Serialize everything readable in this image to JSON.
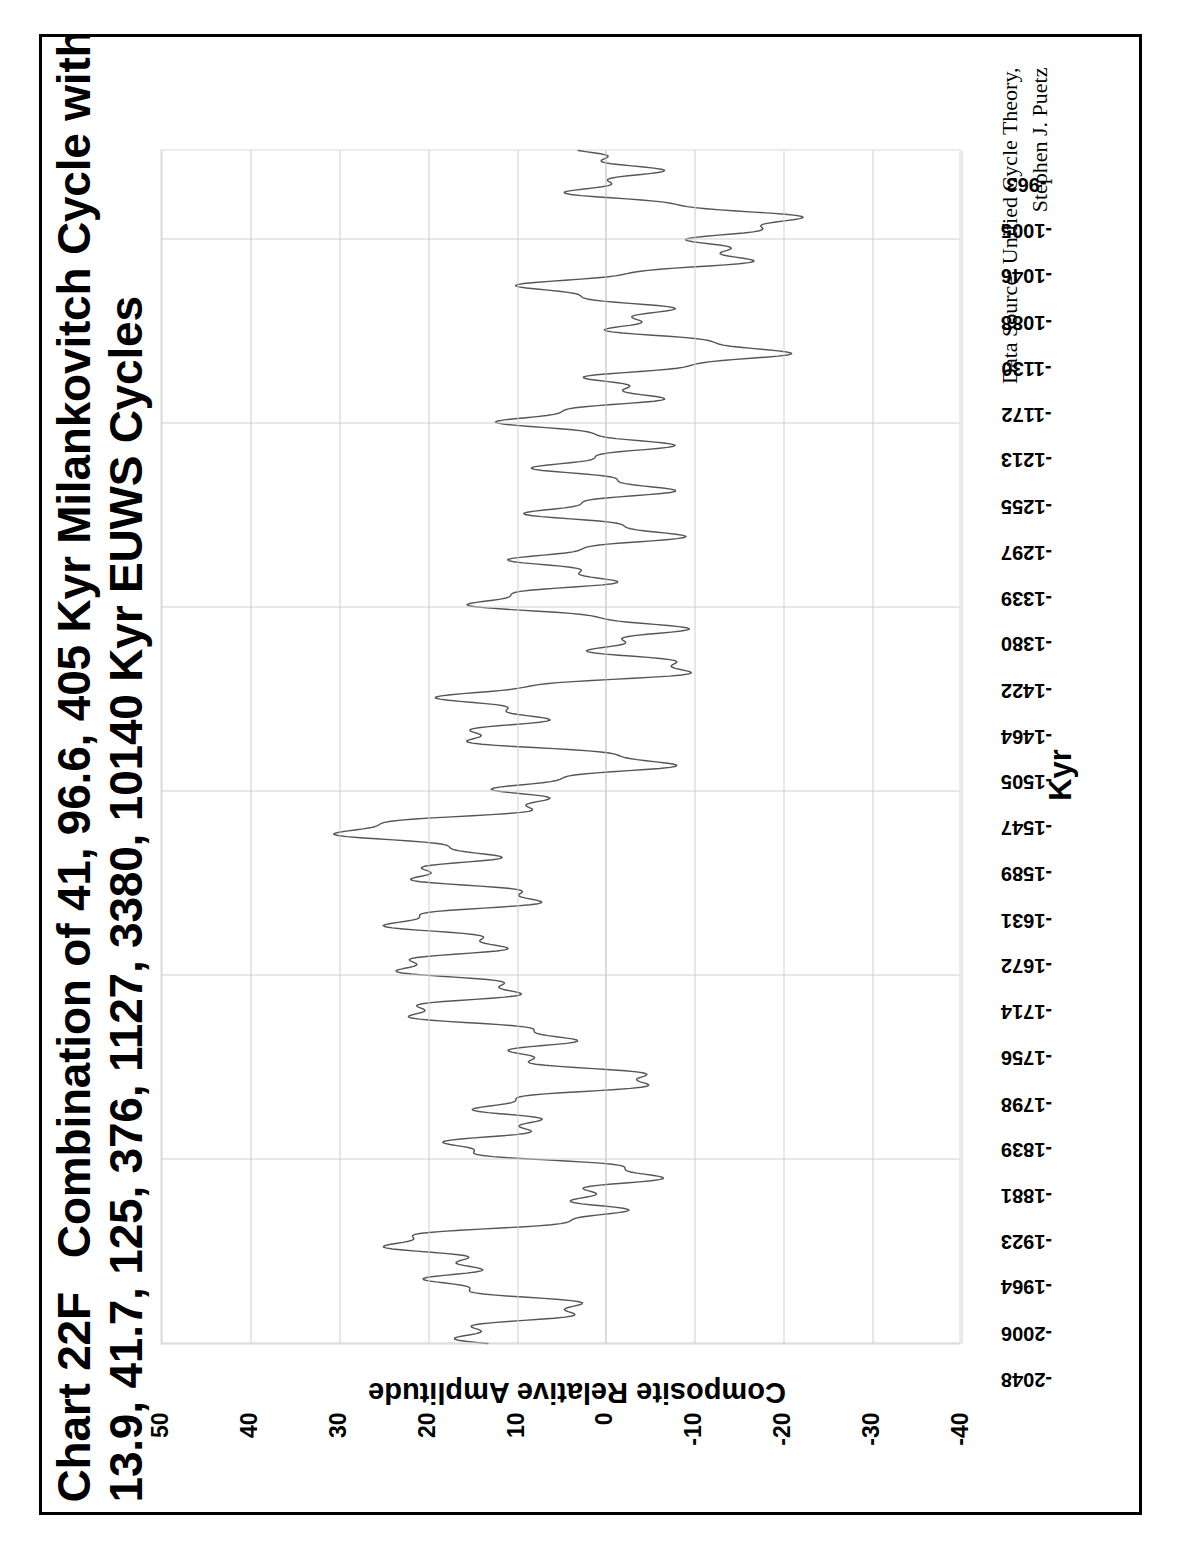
{
  "page": {
    "border_color": "#000000",
    "background": "#ffffff"
  },
  "title": {
    "chart_number": "Chart 22F",
    "line1": "Combination of 41, 96.6, 405 Kyr Milankovitch Cycle with",
    "line2": "13.9, 41.7, 125, 376, 1127, 3380, 10140 Kyr EUWS Cycles"
  },
  "source": {
    "line1": "Data Source:  Unified Cycle Theory,",
    "line2": "Stephen J. Puetz"
  },
  "chart_data": {
    "type": "line",
    "xlabel": "Kyr",
    "ylabel": "Composite Relative Amplitude",
    "xlim": [
      -2048,
      -963
    ],
    "ylim": [
      -40,
      50
    ],
    "grid": true,
    "legend": false,
    "series_color": "#555555",
    "y_ticks": [
      "50",
      "40",
      "30",
      "20",
      "10",
      "0",
      "-10",
      "-20",
      "-30",
      "-40"
    ],
    "y_tick_values": [
      50,
      40,
      30,
      20,
      10,
      0,
      -10,
      -20,
      -30,
      -40
    ],
    "x_ticks": [
      "-2048",
      "-2006",
      "-1964",
      "-1923",
      "-1881",
      "-1839",
      "-1798",
      "-1756",
      "-1714",
      "-1672",
      "-1631",
      "-1589",
      "-1547",
      "-1505",
      "-1464",
      "-1422",
      "-1380",
      "-1339",
      "-1297",
      "-1255",
      "-1213",
      "-1172",
      "-1130",
      "-1088",
      "-1046",
      "-1005",
      "-963"
    ],
    "x_tick_values": [
      -2048,
      -2006,
      -1964,
      -1923,
      -1881,
      -1839,
      -1798,
      -1756,
      -1714,
      -1672,
      -1631,
      -1589,
      -1547,
      -1505,
      -1464,
      -1422,
      -1380,
      -1339,
      -1297,
      -1255,
      -1213,
      -1172,
      -1130,
      -1088,
      -1046,
      -1005,
      -963
    ],
    "x_gridline_values": [
      -2048,
      -1881,
      -1714,
      -1547,
      -1380,
      -1213,
      -1046
    ],
    "series": [
      {
        "name": "Composite of 41, 96.6, 405 Kyr Milankovitch + 13.9, 41.7, 125, 376, 1127, 3380, 10140 Kyr EUWS cycles",
        "cycle_periods_kyr": [
          41,
          96.6,
          405,
          13.9,
          41.7,
          125,
          376,
          1127,
          3380,
          10140
        ],
        "x_start": -2048,
        "x_end": -963,
        "sample_step_kyr": 1,
        "synthesis": {
          "components": [
            {
              "period": 10140,
              "amplitude": 10.0,
              "phase_deg": 140
            },
            {
              "period": 3380,
              "amplitude": 9.0,
              "phase_deg": 20
            },
            {
              "period": 1127,
              "amplitude": 7.0,
              "phase_deg": 250
            },
            {
              "period": 405,
              "amplitude": 6.5,
              "phase_deg": 60
            },
            {
              "period": 376,
              "amplitude": 5.0,
              "phase_deg": 300
            },
            {
              "period": 125,
              "amplitude": 5.5,
              "phase_deg": 10
            },
            {
              "period": 96.6,
              "amplitude": 4.5,
              "phase_deg": 190
            },
            {
              "period": 41.7,
              "amplitude": 3.5,
              "phase_deg": 75
            },
            {
              "period": 41,
              "amplitude": 3.5,
              "phase_deg": 285
            },
            {
              "period": 13.9,
              "amplitude": 2.0,
              "phase_deg": 120
            }
          ]
        }
      }
    ]
  }
}
